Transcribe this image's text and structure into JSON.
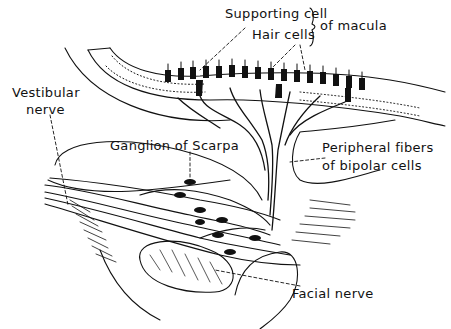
{
  "diagram": {
    "type": "anatomical-illustration",
    "labels": {
      "supporting_cell": "Supporting cell",
      "hair_cells": "Hair cells",
      "of_macula": "of macula",
      "vestibular_nerve_line1": "Vestibular",
      "vestibular_nerve_line2": "nerve",
      "ganglion": "Ganglion of Scarpa",
      "peripheral_line1": "Peripheral fibers",
      "peripheral_line2": "of bipolar cells",
      "facial_nerve": "Facial nerve"
    },
    "colors": {
      "ink": "#111111",
      "background": "#ffffff"
    }
  }
}
